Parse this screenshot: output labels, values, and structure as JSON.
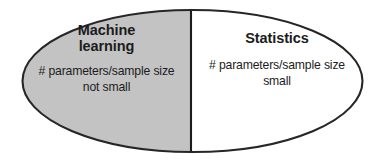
{
  "diagram": {
    "kind": "split-ellipse-diagram",
    "shape": "ellipse",
    "outline_color": "#262626",
    "background_color": "#ffffff",
    "divider_color": "#1c1c1c",
    "left_half": {
      "fill_color": "#c3c3c3",
      "title": "Machine\nlearning",
      "title_line1": "Machine",
      "title_line2": "learning",
      "body_line1": "# parameters/sample size",
      "body_line2": "not small"
    },
    "right_half": {
      "fill_color": "#ffffff",
      "title": "Statistics",
      "title_line1": "Statistics",
      "body_line1": "# parameters/sample size",
      "body_line2": "small"
    }
  }
}
